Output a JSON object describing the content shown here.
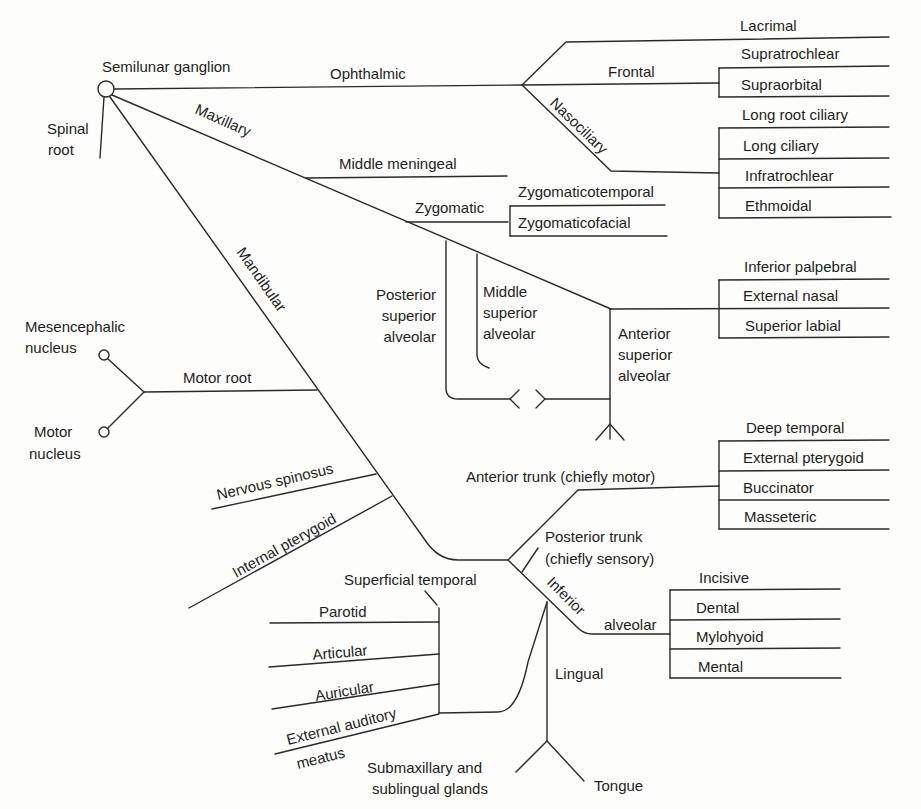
{
  "diagram": {
    "root": {
      "ganglion": "Semilunar ganglion",
      "spinal_root": [
        "Spinal",
        "root"
      ]
    },
    "ophthalmic": {
      "label": "Ophthalmic",
      "lacrimal": "Lacrimal",
      "frontal": {
        "label": "Frontal",
        "branches": [
          "Supratrochlear",
          "Supraorbital"
        ]
      },
      "nasociliary": {
        "label": "Nasociliary",
        "branches": [
          "Long root ciliary",
          "Long ciliary",
          "Infratrochlear",
          "Ethmoidal"
        ]
      }
    },
    "maxillary": {
      "label": "Maxillary",
      "middle_meningeal": "Middle meningeal",
      "zygomatic": {
        "label": "Zygomatic",
        "branches": [
          "Zygomaticotemporal",
          "Zygomaticofacial"
        ]
      },
      "posterior_superior_alveolar": [
        "Posterior",
        "superior",
        "alveolar"
      ],
      "middle_superior_alveolar": [
        "Middle",
        "superior",
        "alveolar"
      ],
      "anterior_superior_alveolar": [
        "Anterior",
        "superior",
        "alveolar"
      ],
      "infraorbital_branches": [
        "Inferior palpebral",
        "External nasal",
        "Superior labial"
      ]
    },
    "mandibular": {
      "label": "Mandibular",
      "motor_root": {
        "label": "Motor root",
        "mesencephalic": [
          "Mesencephalic",
          "nucleus"
        ],
        "motor_nucleus": [
          "Motor",
          "nucleus"
        ]
      },
      "nervous_spinosus": "Nervous spinosus",
      "internal_pterygoid": "Internal pterygoid",
      "anterior_trunk": {
        "label": "Anterior trunk (chiefly motor)",
        "branches": [
          "Deep temporal",
          "External pterygoid",
          "Buccinator",
          "Masseteric"
        ]
      },
      "posterior_trunk": [
        "Posterior trunk",
        "(chiefly sensory)"
      ],
      "auriculotemporal": {
        "superficial_temporal": "Superficial temporal",
        "branches": [
          "Parotid",
          "Articular",
          "Auricular",
          "External auditory"
        ],
        "meatus": "meatus"
      },
      "inferior_alveolar": {
        "label_inferior": "Inferior",
        "label_alveolar": "alveolar",
        "branches": [
          "Incisive",
          "Dental",
          "Mylohyoid",
          "Mental"
        ]
      },
      "lingual": {
        "label": "Lingual",
        "glands": [
          "Submaxillary and",
          "sublingual glands"
        ],
        "tongue": "Tongue"
      }
    }
  }
}
